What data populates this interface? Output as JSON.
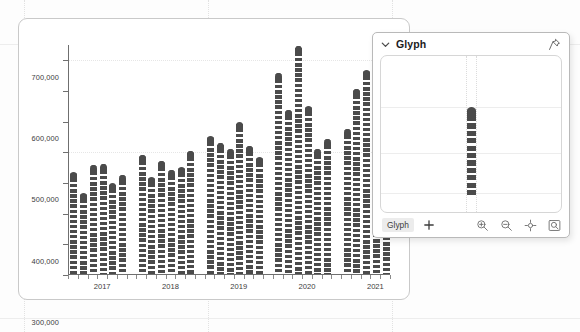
{
  "chart_data": {
    "type": "bar",
    "title": "",
    "xlabel": "",
    "ylabel": "",
    "ylim": [
      0,
      750000
    ],
    "grid": true,
    "legend": "none",
    "y_ticks": [
      "0",
      "100,000",
      "200,000",
      "300,000",
      "400,000",
      "500,000",
      "600,000",
      "700,000"
    ],
    "y_tick_values": [
      0,
      100000,
      200000,
      300000,
      400000,
      500000,
      600000,
      700000
    ],
    "x_tick_labels": [
      "2017",
      "2018",
      "2019",
      "2020",
      "2021"
    ],
    "categories": [
      "2017 Q1",
      "2017 Q2",
      "2017 Q3",
      "2017 Q4",
      "2017 Q5",
      "2017 Q6",
      "2017 Q7",
      "2018 Q1",
      "2018 Q2",
      "2018 Q3",
      "2018 Q4",
      "2018 Q5",
      "2018 Q6",
      "2018 Q7",
      "2019 Q1",
      "2019 Q2",
      "2019 Q3",
      "2019 Q4",
      "2019 Q5",
      "2019 Q6",
      "2019 Q7",
      "2020 Q1",
      "2020 Q2",
      "2020 Q3",
      "2020 Q4",
      "2020 Q5",
      "2020 Q6",
      "2020 Q7",
      "2021 Q1",
      "2021 Q2",
      "2021 Q3",
      "2021 Q4",
      "2021 Q5"
    ],
    "values": [
      335000,
      268000,
      360000,
      362000,
      300000,
      327000,
      0,
      392000,
      318000,
      372000,
      344000,
      352000,
      406000,
      0,
      452000,
      432000,
      410000,
      498000,
      421000,
      384000,
      0,
      659000,
      537000,
      747000,
      551000,
      410000,
      442000,
      0,
      477000,
      608000,
      667000,
      338000,
      330000
    ],
    "series_name": "value",
    "bar_style": {
      "fill": "#4b4b4b",
      "rounded_top": true,
      "pattern": "dashed-white-stripes"
    }
  },
  "glyph_panel": {
    "title": "Glyph",
    "collapse_icon": "chevron-down-icon",
    "pin_icon": "pin-icon",
    "canvas": {
      "glyph_value_label": "",
      "bar_fill": "#4b4b4b"
    },
    "footer": {
      "tab_label": "Glyph",
      "add_icon": "plus-icon",
      "tools": [
        {
          "name": "zoom-in-icon",
          "label": "Zoom In"
        },
        {
          "name": "zoom-out-icon",
          "label": "Zoom Out"
        },
        {
          "name": "fit-to-view-icon",
          "label": "Fit To View"
        },
        {
          "name": "zoom-to-selection-icon",
          "label": "Zoom To Selection"
        }
      ]
    }
  }
}
